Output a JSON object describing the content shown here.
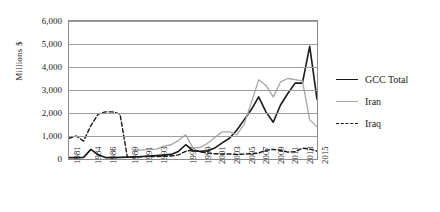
{
  "chart_data": {
    "type": "line",
    "title": "",
    "xlabel": "",
    "ylabel": "Millions $",
    "ylim": [
      0,
      6000
    ],
    "ytick_labels": [
      "6,000",
      "5,000",
      "4,000",
      "3,000",
      "2,000",
      "1,000",
      "0"
    ],
    "ytick_values": [
      6000,
      5000,
      4000,
      3000,
      2000,
      1000,
      0
    ],
    "grid": true,
    "legend_position": "right",
    "x": [
      1981,
      1982,
      1983,
      1984,
      1985,
      1986,
      1987,
      1988,
      1989,
      1990,
      1991,
      1992,
      1993,
      1994,
      1995,
      1996,
      1997,
      1998,
      1999,
      2000,
      2001,
      2002,
      2003,
      2004,
      2005,
      2006,
      2007,
      2008,
      2009,
      2010,
      2011,
      2012,
      2013,
      2014,
      2015
    ],
    "xtick_labels": [
      "1981",
      "1984",
      "1986",
      "1989",
      "1991",
      "1993",
      "1997",
      "1999",
      "2001",
      "2003",
      "2005",
      "2007",
      "2009",
      "2011",
      "2013",
      "2015"
    ],
    "xtick_years": [
      1981,
      1984,
      1986,
      1989,
      1991,
      1993,
      1997,
      1999,
      2001,
      2003,
      2005,
      2007,
      2009,
      2011,
      2013,
      2015
    ],
    "series": [
      {
        "name": "GCC Total",
        "color": "#1a1a1a",
        "style": "solid",
        "values": [
          60,
          60,
          70,
          420,
          180,
          60,
          60,
          70,
          80,
          90,
          110,
          130,
          150,
          170,
          200,
          330,
          620,
          360,
          330,
          360,
          480,
          700,
          900,
          1250,
          1700,
          2150,
          2700,
          2050,
          1600,
          2350,
          2850,
          3300,
          3300,
          4900,
          2600
        ]
      },
      {
        "name": "Iran",
        "color": "#a6a6a6",
        "style": "solid",
        "values": [
          null,
          null,
          null,
          null,
          null,
          null,
          null,
          null,
          null,
          380,
          400,
          410,
          430,
          560,
          620,
          800,
          1050,
          480,
          500,
          680,
          930,
          1180,
          1180,
          1050,
          1500,
          2450,
          3450,
          3200,
          2700,
          3350,
          3500,
          3450,
          3400,
          1700,
          1400
        ]
      },
      {
        "name": "Iraq",
        "color": "#1a1a1a",
        "style": "dashed",
        "values": [
          900,
          1000,
          780,
          1450,
          1950,
          2050,
          2050,
          1950,
          80,
          90,
          100,
          110,
          110,
          120,
          130,
          180,
          330,
          400,
          310,
          260,
          230,
          220,
          220,
          200,
          210,
          230,
          260,
          380,
          420,
          380,
          300,
          320,
          470,
          430,
          350
        ]
      }
    ]
  },
  "legend": {
    "items": [
      {
        "label": "GCC Total"
      },
      {
        "label": "Iran"
      },
      {
        "label": "Iraq"
      }
    ]
  }
}
